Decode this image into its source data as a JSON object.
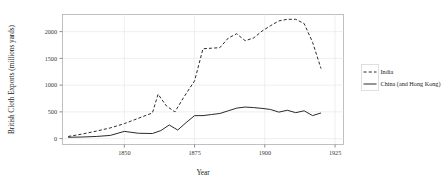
{
  "chart_data": {
    "type": "line",
    "title": "",
    "xlabel": "Year",
    "ylabel": "British Cloth Exports (millions yards)",
    "xlim": [
      1828,
      1928
    ],
    "ylim": [
      -110,
      2320
    ],
    "xticks": [
      1850,
      1875,
      1900,
      1925
    ],
    "xtick_labels": [
      "1850",
      "1875",
      "1900",
      "1925"
    ],
    "yticks": [
      0,
      500,
      1000,
      1500,
      2000
    ],
    "ytick_labels": [
      "0",
      "500",
      "1000",
      "1500",
      "2000"
    ],
    "grid": true,
    "legend_position": "right",
    "series": [
      {
        "name": "India",
        "style": "dashed",
        "color": "#2b2b2b",
        "x": [
          1830,
          1835,
          1840,
          1845,
          1850,
          1855,
          1860,
          1862,
          1865,
          1868,
          1871,
          1875,
          1878,
          1881,
          1884,
          1887,
          1890,
          1893,
          1896,
          1899,
          1902,
          1905,
          1908,
          1911,
          1914,
          1917,
          1920
        ],
        "y": [
          40,
          85,
          140,
          200,
          280,
          380,
          480,
          830,
          610,
          500,
          760,
          1080,
          1680,
          1690,
          1700,
          1880,
          1960,
          1830,
          1880,
          2010,
          2110,
          2200,
          2230,
          2230,
          2150,
          1800,
          1310
        ]
      },
      {
        "name": "China (and Hong Kong)",
        "style": "solid",
        "color": "#2b2b2b",
        "x": [
          1830,
          1835,
          1840,
          1845,
          1850,
          1855,
          1860,
          1863,
          1866,
          1869,
          1872,
          1875,
          1878,
          1881,
          1884,
          1887,
          1890,
          1893,
          1896,
          1899,
          1902,
          1905,
          1908,
          1911,
          1914,
          1917,
          1920
        ],
        "y": [
          25,
          30,
          40,
          60,
          135,
          100,
          95,
          150,
          255,
          160,
          300,
          430,
          430,
          450,
          470,
          520,
          570,
          590,
          580,
          565,
          545,
          495,
          530,
          485,
          520,
          430,
          480
        ]
      }
    ],
    "legend": [
      {
        "label": "India",
        "style": "dashed"
      },
      {
        "label": "China (and Hong Kong)",
        "style": "solid"
      }
    ]
  }
}
